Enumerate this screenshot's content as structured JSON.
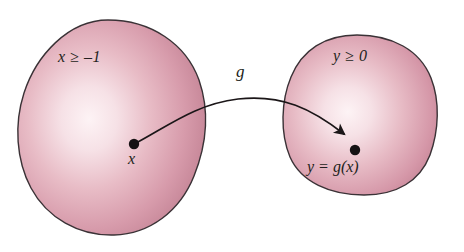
{
  "figure": {
    "caption": "Function mapping diagram: g maps x in the domain to y = g(x) in the range",
    "background_color": "#ffffff"
  },
  "sets": {
    "domain": {
      "name": "domain-set",
      "condition_label": "x ≥ –1",
      "point_label": "x"
    },
    "range": {
      "name": "range-set",
      "condition_label": "y ≥ 0",
      "point_label": "y = g(x)"
    }
  },
  "mapping": {
    "function_label": "g",
    "arrow_name": "mapping-arrow"
  },
  "colors": {
    "blob_highlight": "#fdf2f4",
    "blob_mid": "#e6b8c2",
    "blob_edge": "#c9808f",
    "blob_rim": "#b06b7c",
    "outline": "#3a3236",
    "ink": "#231f20"
  }
}
